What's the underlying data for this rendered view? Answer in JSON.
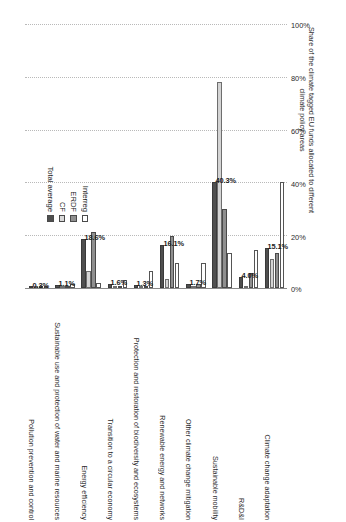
{
  "chart_data": {
    "type": "bar",
    "title": "",
    "orientation": "rotated-90-ccw",
    "xlabel": "",
    "ylabel": "Share of the climate tagged EU funds allocated to different climate policy areas",
    "ylim": [
      0,
      100
    ],
    "ytick_labels": [
      "0%",
      "20%",
      "40%",
      "60%",
      "80%",
      "100%"
    ],
    "ytick_values": [
      0,
      20,
      40,
      60,
      80,
      100
    ],
    "grid": true,
    "legend_position": "top-right",
    "categories": [
      "Pollution prevention and control",
      "Sustainable use and protection of water and marine resources",
      "Energy efficiency",
      "Transition to a circular economy",
      "Protection and restoration of biodiversity and ecosystems",
      "Renewable energy and networks",
      "Other climate change mitigation",
      "Sustainable mobility",
      "R&D&I",
      "Climate change adaptation"
    ],
    "series": [
      {
        "name": "Total average",
        "color": "#4f4f4f",
        "values": [
          0.3,
          1.1,
          18.6,
          1.6,
          1.3,
          16.1,
          1.7,
          40.3,
          4.0,
          15.1
        ]
      },
      {
        "name": "CF",
        "color": "#d4d4d4",
        "values": [
          0.0,
          0.4,
          6.4,
          0.0,
          0.5,
          3.4,
          0.0,
          78.0,
          0.0,
          10.8
        ]
      },
      {
        "name": "ERDF",
        "color": "#8f8f8f",
        "values": [
          0.4,
          0.8,
          21.4,
          0.5,
          0.7,
          19.6,
          1.5,
          29.8,
          5.5,
          13.4
        ]
      },
      {
        "name": "Interreg",
        "color": "#ffffff",
        "values": [
          0.2,
          1.6,
          2.0,
          3.0,
          6.6,
          9.6,
          9.6,
          13.2,
          14.3,
          40.2
        ]
      }
    ],
    "data_labels": [
      "0.3%",
      "1.1%",
      "18.6%",
      "1.6%",
      "1.3%",
      "16.1%",
      "1.7%",
      "40.3%",
      "4.0%",
      "15.1%"
    ]
  },
  "legend": {
    "items": [
      {
        "label": "Total average",
        "key": "total"
      },
      {
        "label": "CF",
        "key": "cf"
      },
      {
        "label": "ERDF",
        "key": "erdf"
      },
      {
        "label": "Interreg",
        "key": "interreg"
      }
    ]
  }
}
